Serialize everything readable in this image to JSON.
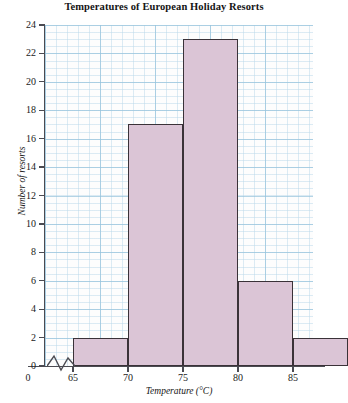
{
  "chart_data": {
    "type": "bar",
    "title": "Temperatures of European Holiday Resorts",
    "xlabel": "Temperature (°C)",
    "ylabel": "Number of resorts",
    "categories": [
      "65–70",
      "70–75",
      "75–80",
      "80–85",
      "85–90"
    ],
    "bin_edges": [
      65,
      70,
      75,
      80,
      85,
      90
    ],
    "values": [
      2,
      17,
      23,
      6,
      2
    ],
    "xlim": [
      65,
      90
    ],
    "ylim": [
      0,
      24
    ],
    "x_tick_labels": [
      "0",
      "65",
      "70",
      "75",
      "80",
      "85"
    ],
    "y_tick_labels": [
      "0",
      "2",
      "4",
      "6",
      "8",
      "10",
      "12",
      "14",
      "16",
      "18",
      "20",
      "22",
      "24"
    ],
    "y_ticks": [
      0,
      2,
      4,
      6,
      8,
      10,
      12,
      14,
      16,
      18,
      20,
      22,
      24
    ],
    "x_ticks": [
      65,
      70,
      75,
      80,
      85
    ],
    "grid": true,
    "grid_color": "#96c3dc",
    "legend": null,
    "axis_break": true,
    "bar_fill_color": "#dbc5d6",
    "bar_edge_color": "#3a3238",
    "background_color": "#fdfdfd",
    "origin_label": "0"
  }
}
